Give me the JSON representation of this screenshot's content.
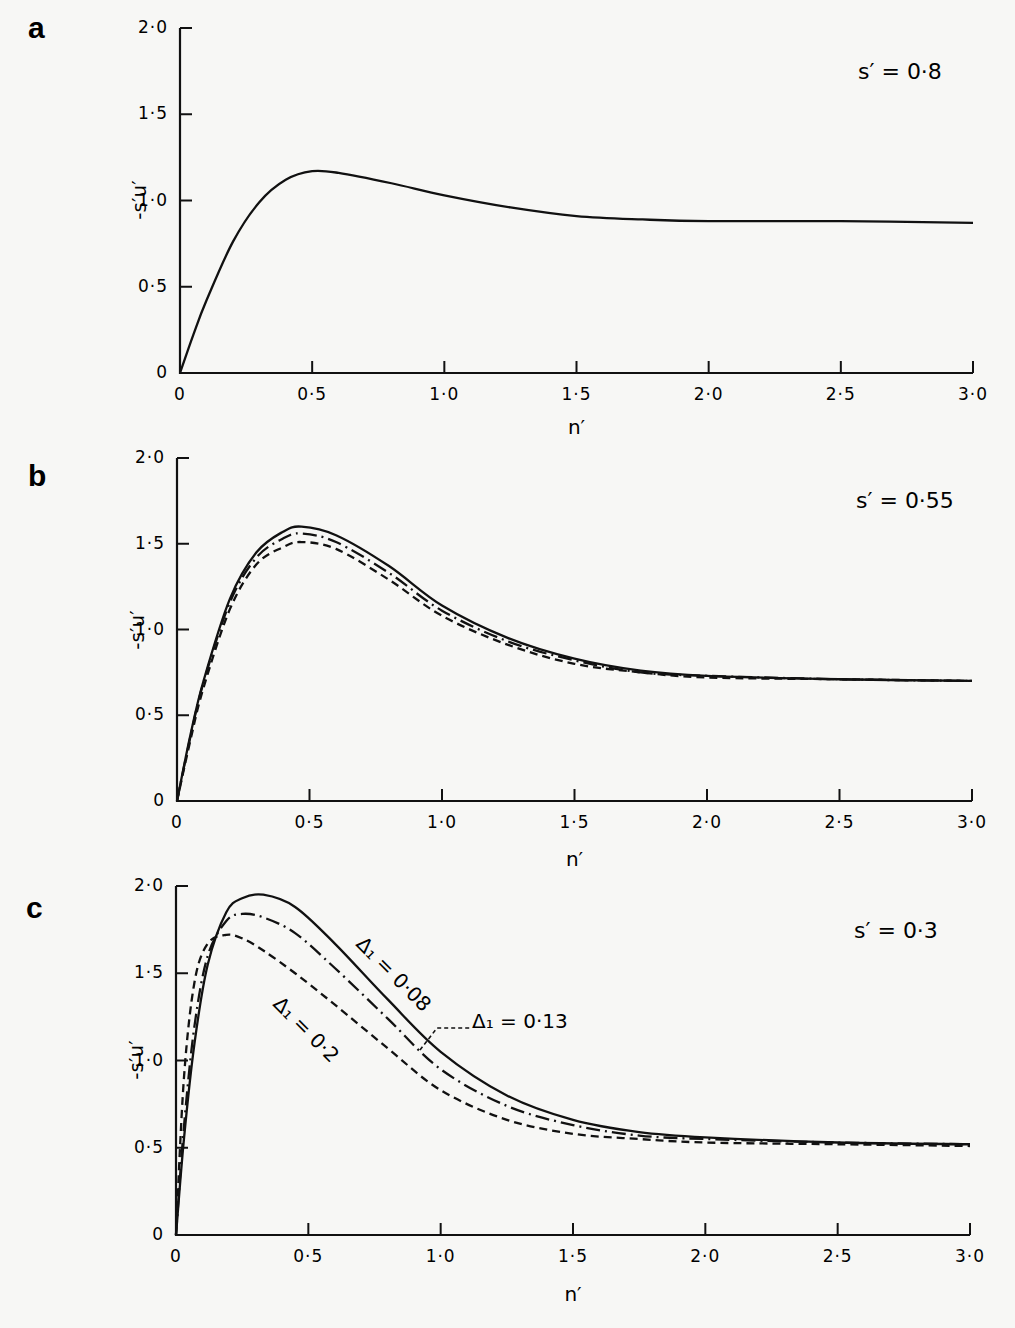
{
  "figure": {
    "panels": [
      {
        "letter": "a",
        "param": "s′ = 0·8",
        "ylabel": "-s′u′",
        "xlabel": "n′"
      },
      {
        "letter": "b",
        "param": "s′ = 0·55",
        "ylabel": "-s′u′",
        "xlabel": "n′"
      },
      {
        "letter": "c",
        "param": "s′ = 0·3",
        "ylabel": "-s′u′",
        "xlabel": "n′",
        "annotations": [
          "Δ₁ = 0·08",
          "Δ₁ = 0·13",
          "Δ₁ = 0·2"
        ]
      }
    ],
    "x_ticks": [
      "0",
      "0·5",
      "1·0",
      "1·5",
      "2·0",
      "2·5",
      "3·0"
    ],
    "y_ticks": [
      "0",
      "0·5",
      "1·0",
      "1·5",
      "2·0"
    ]
  },
  "chart_data": [
    {
      "type": "line",
      "title": "a",
      "subtitle": "s′ = 0·8",
      "xlabel": "n′",
      "ylabel": "-s′u′",
      "xlim": [
        0,
        3.0
      ],
      "ylim": [
        0,
        2.0
      ],
      "grid": false,
      "x": [
        0,
        0.05,
        0.1,
        0.2,
        0.3,
        0.4,
        0.5,
        0.6,
        0.8,
        1.0,
        1.25,
        1.5,
        1.75,
        2.0,
        2.5,
        3.0
      ],
      "series": [
        {
          "name": "solid",
          "style": "solid",
          "values": [
            0,
            0.22,
            0.42,
            0.76,
            0.99,
            1.12,
            1.17,
            1.16,
            1.1,
            1.03,
            0.96,
            0.91,
            0.89,
            0.88,
            0.88,
            0.87
          ]
        }
      ]
    },
    {
      "type": "line",
      "title": "b",
      "subtitle": "s′ = 0·55",
      "xlabel": "n′",
      "ylabel": "-s′u′",
      "xlim": [
        0,
        3.0
      ],
      "ylim": [
        0,
        2.0
      ],
      "grid": false,
      "x": [
        0,
        0.05,
        0.1,
        0.2,
        0.3,
        0.4,
        0.47,
        0.6,
        0.8,
        1.0,
        1.25,
        1.5,
        1.75,
        2.0,
        2.5,
        3.0
      ],
      "series": [
        {
          "name": "solid",
          "style": "solid",
          "values": [
            0,
            0.38,
            0.7,
            1.18,
            1.45,
            1.57,
            1.6,
            1.55,
            1.37,
            1.14,
            0.95,
            0.83,
            0.76,
            0.73,
            0.71,
            0.7
          ]
        },
        {
          "name": "dash-dot",
          "style": "dashdot",
          "values": [
            0,
            0.37,
            0.69,
            1.16,
            1.42,
            1.53,
            1.56,
            1.51,
            1.33,
            1.11,
            0.93,
            0.82,
            0.75,
            0.73,
            0.71,
            0.7
          ]
        },
        {
          "name": "dashed",
          "style": "dashed",
          "values": [
            0,
            0.35,
            0.66,
            1.12,
            1.38,
            1.48,
            1.51,
            1.47,
            1.29,
            1.08,
            0.91,
            0.8,
            0.75,
            0.72,
            0.71,
            0.7
          ]
        }
      ]
    },
    {
      "type": "line",
      "title": "c",
      "subtitle": "s′ = 0·3",
      "xlabel": "n′",
      "ylabel": "-s′u′",
      "xlim": [
        0,
        3.0
      ],
      "ylim": [
        0,
        2.0
      ],
      "grid": false,
      "annotations": [
        "Δ₁ = 0·08",
        "Δ₁ = 0·13",
        "Δ₁ = 0·2"
      ],
      "x": [
        0,
        0.03,
        0.07,
        0.12,
        0.19,
        0.25,
        0.33,
        0.45,
        0.6,
        0.8,
        1.0,
        1.25,
        1.5,
        1.75,
        2.0,
        2.5,
        3.0
      ],
      "series": [
        {
          "name": "Δ₁ = 0·08",
          "style": "solid",
          "values": [
            0,
            0.55,
            1.1,
            1.55,
            1.85,
            1.93,
            1.95,
            1.88,
            1.67,
            1.35,
            1.05,
            0.8,
            0.66,
            0.59,
            0.56,
            0.53,
            0.52
          ]
        },
        {
          "name": "Δ₁ = 0·13",
          "style": "dashdot",
          "values": [
            0,
            0.62,
            1.2,
            1.6,
            1.8,
            1.84,
            1.82,
            1.73,
            1.53,
            1.24,
            0.95,
            0.74,
            0.63,
            0.57,
            0.55,
            0.53,
            0.52
          ]
        },
        {
          "name": "Δ₁ = 0·2",
          "style": "dashed",
          "values": [
            0,
            0.9,
            1.45,
            1.67,
            1.72,
            1.7,
            1.63,
            1.5,
            1.32,
            1.07,
            0.83,
            0.66,
            0.58,
            0.55,
            0.53,
            0.52,
            0.51
          ]
        }
      ]
    }
  ]
}
